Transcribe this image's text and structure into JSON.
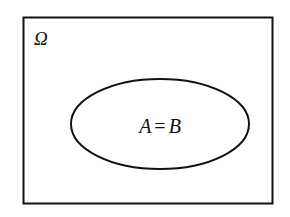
{
  "diagram": {
    "type": "venn",
    "universe": {
      "label": "Ω"
    },
    "sets": [
      {
        "label": "A = B",
        "left": "A",
        "relation": "=",
        "right": "B"
      }
    ],
    "colors": {
      "stroke": "#111111",
      "background": "#ffffff"
    }
  }
}
